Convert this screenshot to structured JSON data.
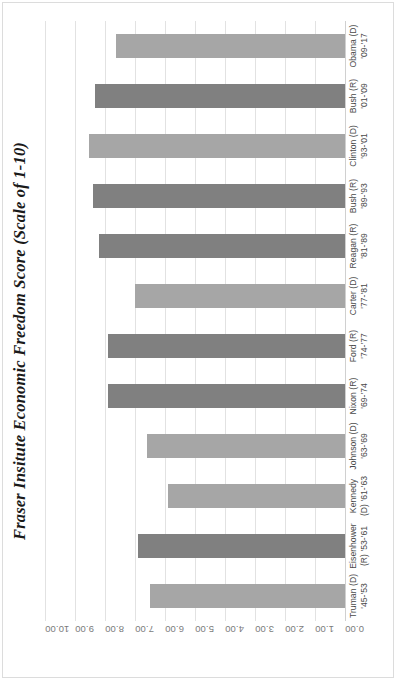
{
  "chart_data": {
    "type": "bar",
    "orientation": "horizontal",
    "title": "Fraser Insitute Economic Freedom Score (Scale of 1-10)",
    "xlabel": "",
    "ylabel": "",
    "ylim": [
      0,
      10
    ],
    "grid": true,
    "legend": "none",
    "tick_labels": [
      "10.00",
      "9.00",
      "8.00",
      "7.00",
      "6.00",
      "5.00",
      "4.00",
      "3.00",
      "2.00",
      "1.00",
      "0.00"
    ],
    "tick_values": [
      10,
      9,
      8,
      7,
      6,
      5,
      4,
      3,
      2,
      1,
      0
    ],
    "categories": [
      "Truman (D) '45-'53",
      "Eisenhower (R) '53-'61",
      "Kennedy (D) '61-'63",
      "Johnson (D) '63-'69",
      "Nixon (R) '69-'74",
      "Ford (R) '74-'77",
      "Carter (D) '77-'81",
      "Reagan (R) '81-'89",
      "Bush (R) '89-'93",
      "Clinton (D) '93-'01",
      "Bush (R) '01-'09",
      "Obama (D) '09-'17"
    ],
    "category_lines": [
      {
        "l1": "Truman (D)",
        "l2": "'45-'53"
      },
      {
        "l1": "Eisenhower",
        "l2": "(R) '53-'61"
      },
      {
        "l1": "Kennedy",
        "l2": "(D) '61-'63"
      },
      {
        "l1": "Johnson (D)",
        "l2": "'63-'69"
      },
      {
        "l1": "Nixon (R)",
        "l2": "'69-'74"
      },
      {
        "l1": "Ford (R)",
        "l2": "'74-'77"
      },
      {
        "l1": "Carter (D)",
        "l2": "'77-'81"
      },
      {
        "l1": "Reagan (R)",
        "l2": "'81-'89"
      },
      {
        "l1": "Bush (R)",
        "l2": "'89-'93"
      },
      {
        "l1": "Clinton (D)",
        "l2": "'93-'01"
      },
      {
        "l1": "Bush (R)",
        "l2": "'01-'09"
      },
      {
        "l1": "Obama (D)",
        "l2": "'09-'17"
      }
    ],
    "values": [
      6.5,
      6.9,
      5.9,
      6.6,
      7.9,
      7.9,
      7.0,
      8.2,
      8.4,
      8.55,
      8.35,
      7.65
    ],
    "party": [
      "D",
      "R",
      "D",
      "D",
      "R",
      "R",
      "D",
      "R",
      "R",
      "D",
      "R",
      "D"
    ],
    "colors": {
      "democrat_bar": "#a6a6a6",
      "republican_bar": "#808080",
      "gridline": "#e2e2e2",
      "baseline": "#d0d0d0",
      "tick_text": "#7b7b7b",
      "category_text": "#4a4a4a",
      "title_text": "#1a1a1a",
      "frame_border": "#dcdcdc",
      "background": "#ffffff"
    }
  }
}
